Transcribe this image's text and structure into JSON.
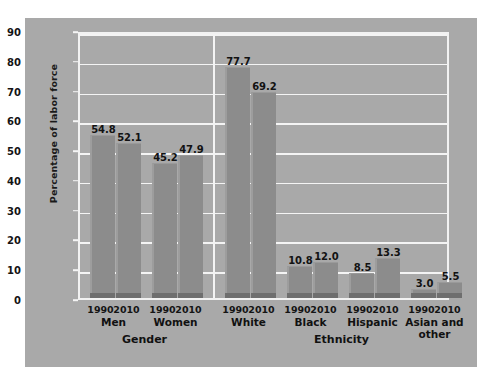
{
  "chart_data": {
    "type": "bar",
    "title": "",
    "xlabel": "",
    "ylabel": "Percentage of labor force",
    "ylim": [
      0,
      90
    ],
    "yticks": [
      0,
      10,
      20,
      30,
      40,
      50,
      60,
      70,
      80,
      90
    ],
    "grid": true,
    "legend": "none",
    "sections": [
      {
        "name": "Gender",
        "groups": [
          {
            "label": "Men",
            "bars": [
              {
                "year": "1990",
                "value": 54.8,
                "label": "54.8"
              },
              {
                "year": "2010",
                "value": 52.1,
                "label": "52.1"
              }
            ]
          },
          {
            "label": "Women",
            "bars": [
              {
                "year": "1990",
                "value": 45.2,
                "label": "45.2"
              },
              {
                "year": "2010",
                "value": 47.9,
                "label": "47.9"
              }
            ]
          }
        ]
      },
      {
        "name": "Ethnicity",
        "groups": [
          {
            "label": "White",
            "bars": [
              {
                "year": "1990",
                "value": 77.7,
                "label": "77.7"
              },
              {
                "year": "2010",
                "value": 69.2,
                "label": "69.2"
              }
            ]
          },
          {
            "label": "Black",
            "bars": [
              {
                "year": "1990",
                "value": 10.8,
                "label": "10.8"
              },
              {
                "year": "2010",
                "value": 12.0,
                "label": "12.0"
              }
            ]
          },
          {
            "label": "Hispanic",
            "bars": [
              {
                "year": "1990",
                "value": 8.5,
                "label": "8.5"
              },
              {
                "year": "2010",
                "value": 13.3,
                "label": "13.3"
              }
            ]
          },
          {
            "label": "Asian and\nother",
            "bars": [
              {
                "year": "1990",
                "value": 3.0,
                "label": "3.0"
              },
              {
                "year": "2010",
                "value": 5.5,
                "label": "5.5"
              }
            ]
          }
        ]
      }
    ],
    "categories": [
      "Men 1990",
      "Men 2010",
      "Women 1990",
      "Women 2010",
      "White 1990",
      "White 2010",
      "Black 1990",
      "Black 2010",
      "Hispanic 1990",
      "Hispanic 2010",
      "Asian and other 1990",
      "Asian and other 2010"
    ],
    "values": [
      54.8,
      52.1,
      45.2,
      47.9,
      77.7,
      69.2,
      10.8,
      12.0,
      8.5,
      13.3,
      3.0,
      5.5
    ]
  },
  "colors": {
    "figure_background": "#a9a9a9",
    "bar_fill": "#8c8c8c",
    "bar_base": "#6e6e6e",
    "gridline": "#f4f4f4",
    "text": "#121212"
  }
}
